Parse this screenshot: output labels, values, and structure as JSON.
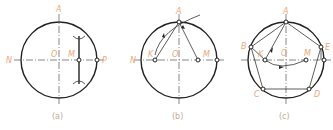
{
  "figure": {
    "panels": [
      {
        "id": "a",
        "caption": "(a)",
        "labels": {
          "A": "A",
          "N": "N",
          "O": "O",
          "M": "M",
          "P": "P"
        }
      },
      {
        "id": "b",
        "caption": "(b)",
        "labels": {
          "A": "A",
          "N": "N",
          "K": "K",
          "O": "O",
          "M": "M"
        }
      },
      {
        "id": "c",
        "caption": "(c)",
        "labels": {
          "A": "A",
          "B": "B",
          "E": "E",
          "K": "K",
          "O": "O",
          "M": "M",
          "C": "C",
          "D": "D"
        }
      }
    ],
    "colors": {
      "label": "#e8a878",
      "line": "#222222"
    }
  }
}
